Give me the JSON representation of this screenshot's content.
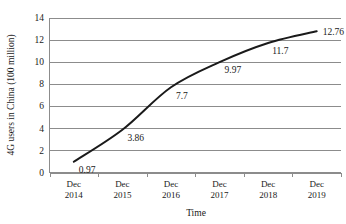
{
  "chart_data": {
    "type": "line",
    "title": "",
    "xlabel": "Time",
    "ylabel": "4G users in China (100 million)",
    "categories": [
      "Dec 2014",
      "Dec 2015",
      "Dec 2016",
      "Dec 2017",
      "Dec 2018",
      "Dec 2019"
    ],
    "category_lines": [
      [
        "Dec",
        "2014"
      ],
      [
        "Dec",
        "2015"
      ],
      [
        "Dec",
        "2016"
      ],
      [
        "Dec",
        "2017"
      ],
      [
        "Dec",
        "2018"
      ],
      [
        "Dec",
        "2019"
      ]
    ],
    "values": [
      0.97,
      3.86,
      7.7,
      9.97,
      11.7,
      12.76
    ],
    "point_labels": [
      "0.97",
      "3.86",
      "7.7",
      "9.97",
      "11.7",
      "12.76"
    ],
    "ylim": [
      0,
      14
    ],
    "yticks": [
      0,
      2,
      4,
      6,
      8,
      10,
      12,
      14
    ],
    "ytick_labels": [
      "0",
      "2",
      "4",
      "6",
      "8",
      "10",
      "12",
      "14"
    ],
    "grid": true,
    "grid_axis": "y",
    "legend": false,
    "legend_position": "none",
    "series_color": "#1a1a1a",
    "grid_color": "#8c8c8c",
    "background_color": "#ffffff"
  }
}
